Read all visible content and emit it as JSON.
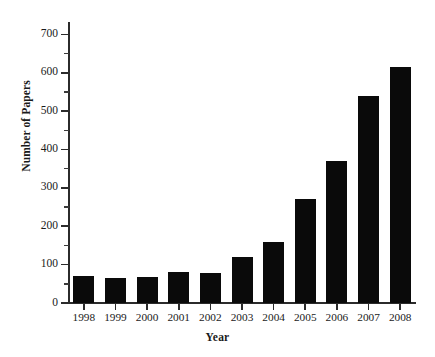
{
  "chart_data": {
    "type": "bar",
    "title": "",
    "xlabel": "Year",
    "ylabel": "Number of Papers",
    "categories": [
      "1998",
      "1999",
      "2000",
      "2001",
      "2002",
      "2003",
      "2004",
      "2005",
      "2006",
      "2007",
      "2008"
    ],
    "values": [
      70,
      65,
      68,
      81,
      77,
      120,
      160,
      270,
      370,
      540,
      615
    ],
    "series": [
      {
        "name": "Number of Papers",
        "values": [
          70,
          65,
          68,
          81,
          77,
          120,
          160,
          270,
          370,
          540,
          615
        ]
      }
    ],
    "ylim": [
      0,
      740
    ],
    "xlim_note": "categorical",
    "y_major_ticks": [
      0,
      100,
      200,
      300,
      400,
      500,
      600,
      700
    ],
    "y_tick_labels": [
      "0",
      "100",
      "200",
      "300",
      "400",
      "500",
      "600",
      "700"
    ],
    "y_minor_tick_interval": 50,
    "grid": false,
    "legend": null,
    "legend_position": "none",
    "bar_color": "#0a0a0a",
    "axis_color": "#2b2b2b",
    "background_color": "#ffffff",
    "annotations": []
  }
}
